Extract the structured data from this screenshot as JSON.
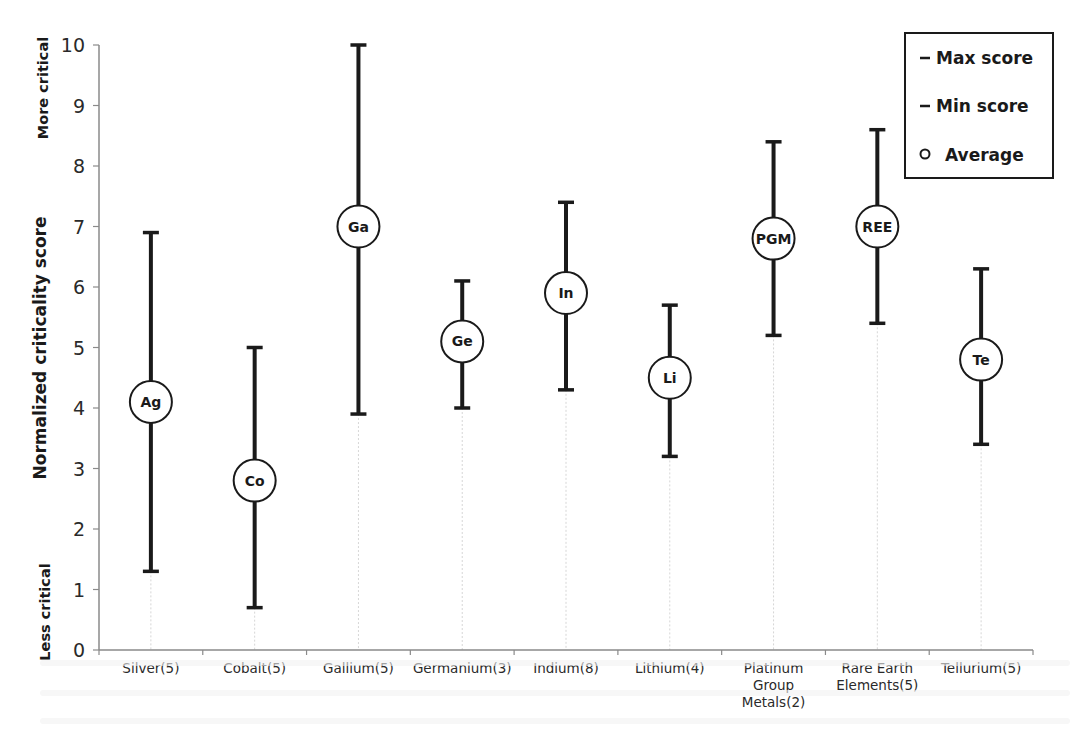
{
  "chart_data": {
    "type": "errorbar",
    "title": "",
    "xlabel": "",
    "ylabel": "Normalized criticality score",
    "ylim": [
      0,
      10
    ],
    "yticks": [
      0,
      1,
      2,
      3,
      4,
      5,
      6,
      7,
      8,
      9,
      10
    ],
    "grid": false,
    "annotations": {
      "top": "More critical",
      "bottom": "Less critical"
    },
    "legend": {
      "position": "top-right",
      "entries": [
        {
          "marker": "–",
          "label": "Max score"
        },
        {
          "marker": "–",
          "label": "Min score"
        },
        {
          "marker": "○",
          "label": "Average"
        }
      ]
    },
    "categories": [
      "Silver(5)",
      "Cobalt(5)",
      "Gallium(5)",
      "Germanium(3)",
      "Indium(8)",
      "Lithium(4)",
      "Platinum Group Metals(2)",
      "Rare Earth Elements(5)",
      "Tellurium(5)"
    ],
    "category_lines": [
      [
        "Silver(5)"
      ],
      [
        "Cobalt(5)"
      ],
      [
        "Gallium(5)"
      ],
      [
        "Germanium(3)"
      ],
      [
        "Indium(8)"
      ],
      [
        "Lithium(4)"
      ],
      [
        "Platinum",
        "Group",
        "Metals(2)"
      ],
      [
        "Rare Earth",
        "Elements(5)"
      ],
      [
        "Tellurium(5)"
      ]
    ],
    "symbols": [
      "Ag",
      "Co",
      "Ga",
      "Ge",
      "In",
      "Li",
      "PGM",
      "REE",
      "Te"
    ],
    "series": [
      {
        "name": "Max score",
        "values": [
          6.9,
          5.0,
          10.0,
          6.1,
          7.4,
          5.7,
          8.4,
          8.6,
          6.3
        ]
      },
      {
        "name": "Min score",
        "values": [
          1.3,
          0.7,
          3.9,
          4.0,
          4.3,
          3.2,
          5.2,
          5.4,
          3.4
        ]
      },
      {
        "name": "Average",
        "values": [
          4.1,
          2.8,
          7.0,
          5.1,
          5.9,
          4.5,
          6.8,
          7.0,
          4.8
        ]
      }
    ]
  },
  "layout": {
    "plot_left": 99,
    "plot_right": 1033,
    "y_zero_px": 650,
    "y_ten_px": 45
  }
}
